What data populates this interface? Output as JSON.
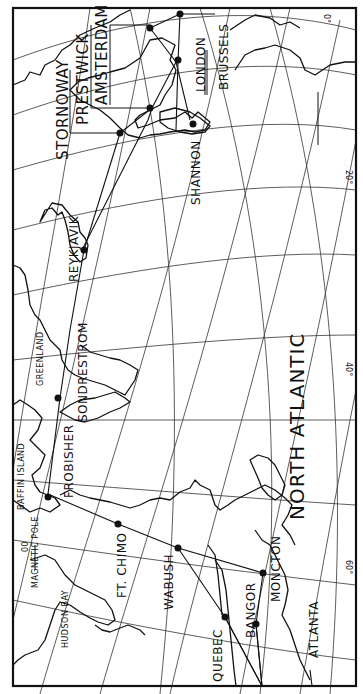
{
  "map": {
    "title": "",
    "orientation": "rotated 90 degrees counter-clockwise (north points left)",
    "ocean_label": "NORTH ATLANTIC",
    "regions": [
      {
        "id": "greenland",
        "label": "GREENLAND"
      },
      {
        "id": "baffin",
        "label": "BAFFIN ISLAND"
      },
      {
        "id": "hudson",
        "label": "HUDSON BAY"
      },
      {
        "id": "magpole",
        "label": "MAGNETIC POLE"
      }
    ],
    "cities": [
      {
        "id": "stornoway",
        "label": "STORNOWAY"
      },
      {
        "id": "prestwick",
        "label": "PRESTWICK"
      },
      {
        "id": "amsterdam",
        "label": "AMSTERDAM"
      },
      {
        "id": "london",
        "label": "LONDON"
      },
      {
        "id": "brussels",
        "label": "BRUSSELS"
      },
      {
        "id": "shannon",
        "label": "SHANNON"
      },
      {
        "id": "reykjavik",
        "label": "REYKJAVIK"
      },
      {
        "id": "sondrestrom",
        "label": "SONDRESTROM"
      },
      {
        "id": "frobisher",
        "label": "FROBISHER"
      },
      {
        "id": "ftchimo",
        "label": "FT. CHIMO"
      },
      {
        "id": "wabush",
        "label": "WABUSH"
      },
      {
        "id": "quebec",
        "label": "QUEBEC"
      },
      {
        "id": "bangor",
        "label": "BANGOR"
      },
      {
        "id": "moncton",
        "label": "MONCTON"
      },
      {
        "id": "atlanta",
        "label": "ATLANTA"
      }
    ],
    "magnetic_pole_marker": "00",
    "edge_ticks": [
      {
        "label": "0°"
      },
      {
        "label": "20°"
      },
      {
        "label": "40°"
      },
      {
        "label": "60°"
      }
    ],
    "colors": {
      "ink": "#111111",
      "paper": "#ffffff"
    }
  }
}
